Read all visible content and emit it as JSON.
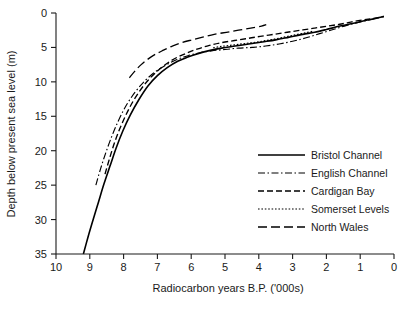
{
  "chart_data": {
    "type": "line",
    "title": "",
    "xlabel": "Radiocarbon years B.P. ('000s)",
    "ylabel": "Depth below present sea level (m)",
    "xlim": [
      10,
      0
    ],
    "ylim": [
      35,
      0
    ],
    "x_ticks": [
      "10",
      "9",
      "8",
      "7",
      "6",
      "5",
      "4",
      "3",
      "2",
      "1",
      "0"
    ],
    "x_tick_values": [
      10,
      9,
      8,
      7,
      6,
      5,
      4,
      3,
      2,
      1,
      0
    ],
    "y_ticks": [
      "0",
      "5",
      "10",
      "15",
      "20",
      "25",
      "30",
      "35"
    ],
    "y_tick_values": [
      0,
      5,
      10,
      15,
      20,
      25,
      30,
      35
    ],
    "x_axis_reversed": true,
    "y_axis_inverted": true,
    "grid": false,
    "legend_position": "lower-right-inside",
    "series": [
      {
        "name": "Bristol Channel",
        "style": "solid",
        "dasharray": "",
        "points": [
          [
            9.19,
            35.0
          ],
          [
            9.05,
            32.5
          ],
          [
            8.9,
            30.0
          ],
          [
            8.74,
            27.4
          ],
          [
            8.58,
            24.8
          ],
          [
            8.4,
            22.2
          ],
          [
            8.22,
            19.6
          ],
          [
            8.02,
            17.1
          ],
          [
            7.8,
            14.8
          ],
          [
            7.55,
            12.6
          ],
          [
            7.28,
            10.6
          ],
          [
            7.0,
            9.1
          ],
          [
            6.7,
            7.9
          ],
          [
            6.4,
            7.0
          ],
          [
            6.1,
            6.4
          ],
          [
            5.8,
            5.9
          ],
          [
            5.5,
            5.5
          ],
          [
            5.1,
            5.1
          ],
          [
            4.7,
            4.8
          ],
          [
            4.3,
            4.5
          ],
          [
            3.9,
            4.2
          ],
          [
            3.5,
            3.9
          ],
          [
            3.1,
            3.5
          ],
          [
            2.7,
            3.1
          ],
          [
            2.35,
            2.8
          ],
          [
            2.0,
            2.4
          ],
          [
            1.6,
            1.9
          ],
          [
            1.2,
            1.5
          ],
          [
            0.85,
            1.1
          ],
          [
            0.55,
            0.8
          ],
          [
            0.3,
            0.5
          ]
        ]
      },
      {
        "name": "English Channel",
        "style": "dash-dot",
        "dasharray": "7,2.5,1.5,2.5",
        "points": [
          [
            8.82,
            25.0
          ],
          [
            8.68,
            22.6
          ],
          [
            8.52,
            20.2
          ],
          [
            8.34,
            17.8
          ],
          [
            8.14,
            15.5
          ],
          [
            7.92,
            13.4
          ],
          [
            7.66,
            11.5
          ],
          [
            7.38,
            9.9
          ],
          [
            7.08,
            8.6
          ],
          [
            6.76,
            7.6
          ],
          [
            6.44,
            6.8
          ],
          [
            6.1,
            6.2
          ],
          [
            5.76,
            5.8
          ],
          [
            5.4,
            5.5
          ],
          [
            5.0,
            5.3
          ],
          [
            4.6,
            5.1
          ],
          [
            4.2,
            5.0
          ],
          [
            3.8,
            4.8
          ],
          [
            3.4,
            4.5
          ],
          [
            3.0,
            4.1
          ],
          [
            2.6,
            3.6
          ],
          [
            2.2,
            3.0
          ],
          [
            1.8,
            2.4
          ],
          [
            1.4,
            1.8
          ],
          [
            1.0,
            1.3
          ],
          [
            0.65,
            0.9
          ],
          [
            0.3,
            0.5
          ]
        ]
      },
      {
        "name": "Cardigan Bay",
        "style": "dashed",
        "dasharray": "6,3",
        "points": [
          [
            8.55,
            23.4
          ],
          [
            8.42,
            21.2
          ],
          [
            8.28,
            19.0
          ],
          [
            8.12,
            16.9
          ],
          [
            7.94,
            14.9
          ],
          [
            7.74,
            13.0
          ],
          [
            7.52,
            11.3
          ],
          [
            7.28,
            9.8
          ],
          [
            7.02,
            8.5
          ],
          [
            6.74,
            7.4
          ],
          [
            6.44,
            6.5
          ],
          [
            6.12,
            5.8
          ],
          [
            5.8,
            5.2
          ],
          [
            5.46,
            4.7
          ],
          [
            5.1,
            4.3
          ],
          [
            4.72,
            4.0
          ],
          [
            4.34,
            3.7
          ],
          [
            3.96,
            3.4
          ],
          [
            3.56,
            3.1
          ],
          [
            3.16,
            2.8
          ],
          [
            2.76,
            2.5
          ],
          [
            2.36,
            2.2
          ],
          [
            1.96,
            1.9
          ],
          [
            1.56,
            1.6
          ],
          [
            1.16,
            1.2
          ],
          [
            0.76,
            0.9
          ],
          [
            0.4,
            0.6
          ],
          [
            0.3,
            0.5
          ]
        ]
      },
      {
        "name": "Somerset Levels",
        "style": "dotted",
        "dasharray": "1.6,1.8",
        "points": [
          [
            5.35,
            5.05
          ],
          [
            5.1,
            4.85
          ],
          [
            4.85,
            4.7
          ],
          [
            4.6,
            4.55
          ],
          [
            4.35,
            4.4
          ],
          [
            4.1,
            4.25
          ],
          [
            3.85,
            4.05
          ],
          [
            3.6,
            3.85
          ],
          [
            3.35,
            3.6
          ],
          [
            3.1,
            3.35
          ],
          [
            2.85,
            3.1
          ],
          [
            2.6,
            2.85
          ],
          [
            2.4,
            2.65
          ]
        ]
      },
      {
        "name": "North Wales",
        "style": "long-dash",
        "dasharray": "9,4",
        "points": [
          [
            7.83,
            9.4
          ],
          [
            7.66,
            8.4
          ],
          [
            7.48,
            7.5
          ],
          [
            7.28,
            6.7
          ],
          [
            7.06,
            6.0
          ],
          [
            6.82,
            5.4
          ],
          [
            6.56,
            4.8
          ],
          [
            6.28,
            4.3
          ],
          [
            5.98,
            3.9
          ],
          [
            5.66,
            3.5
          ],
          [
            5.32,
            3.1
          ],
          [
            4.96,
            2.8
          ],
          [
            4.6,
            2.5
          ],
          [
            4.24,
            2.2
          ],
          [
            3.92,
            1.9
          ],
          [
            3.78,
            1.7
          ]
        ]
      }
    ]
  },
  "legend": {
    "entries": [
      {
        "label": "Bristol Channel"
      },
      {
        "label": "English Channel"
      },
      {
        "label": "Cardigan Bay"
      },
      {
        "label": "Somerset Levels"
      },
      {
        "label": "North Wales"
      }
    ]
  }
}
